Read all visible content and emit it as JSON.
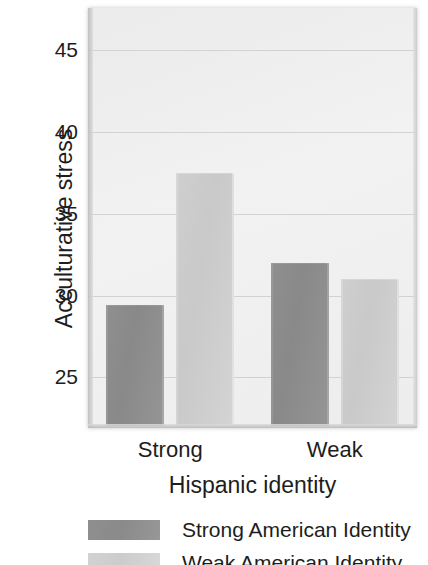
{
  "chart_data": {
    "type": "bar",
    "title": "",
    "xlabel": "Hispanic identity",
    "ylabel": "Acculturative stress",
    "categories": [
      "Strong",
      "Weak"
    ],
    "series": [
      {
        "name": "Strong American Identity",
        "values": [
          29.4,
          32.0
        ],
        "color": "#8a8a8a"
      },
      {
        "name": "Weak American Identity",
        "values": [
          37.5,
          31.0
        ],
        "color": "#cccccc"
      }
    ],
    "ylim": [
      21.9,
      47.6
    ],
    "yticks": [
      45,
      40,
      35,
      30,
      25
    ],
    "ytick_labels": [
      "45",
      "40",
      "35",
      "30",
      "25"
    ],
    "grid": true,
    "grid_axis": "y",
    "legend_position": "below"
  },
  "axes": {
    "y_title": "Acculturative stress",
    "x_title": "Hispanic identity",
    "y_ticks": [
      "45",
      "40",
      "35",
      "30",
      "25"
    ],
    "x_categories": [
      "Strong",
      "Weak"
    ]
  },
  "legend": {
    "entries": [
      {
        "label": "Strong American Identity"
      },
      {
        "label": "Weak American Identity"
      }
    ]
  }
}
